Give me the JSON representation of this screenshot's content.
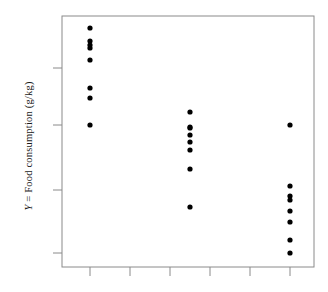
{
  "chart_data": {
    "type": "scatter",
    "title": "",
    "xlabel": "",
    "ylabel": "Y = Food consumption (g/kg)",
    "ylabel_variable": "Y",
    "ylabel_rest": " = Food consumption (g/kg)",
    "grid": false,
    "legend": "none",
    "xlim": [
      0,
      328
    ],
    "ylim": [
      0,
      292
    ],
    "x_tick_labels": [],
    "y_tick_labels": [],
    "x_ticks_px": [
      90,
      130,
      170,
      210,
      250,
      290
    ],
    "y_ticks_px": [
      68,
      125,
      190,
      253
    ],
    "frame_px": {
      "left": 62,
      "right": 314,
      "top": 16,
      "bottom": 267
    },
    "marker": {
      "shape": "circle",
      "color": "#000000",
      "radius": 2.6
    },
    "groups": [
      {
        "name": "group-1",
        "x_px": 90,
        "points_y_px": [
          28,
          41,
          45,
          48,
          60,
          88,
          98,
          125
        ]
      },
      {
        "name": "group-2",
        "x_px": 190,
        "points_y_px": [
          112,
          128,
          127,
          135,
          142,
          150,
          169,
          207
        ]
      },
      {
        "name": "group-3",
        "x_px": 290,
        "points_y_px": [
          125,
          186,
          196,
          200,
          211,
          222,
          240,
          253
        ]
      }
    ],
    "series": [
      {
        "name": "group-1",
        "x": [
          1,
          1,
          1,
          1,
          1,
          1,
          1,
          1
        ],
        "values": [
          95.2,
          90.0,
          88.4,
          87.2,
          82.4,
          71.2,
          67.2,
          56.4
        ]
      },
      {
        "name": "group-2",
        "x": [
          3.5,
          3.5,
          3.5,
          3.5,
          3.5,
          3.5,
          3.5,
          3.5
        ],
        "values": [
          61.2,
          55.6,
          56.0,
          52.8,
          50.0,
          46.8,
          39.2,
          24.0
        ]
      },
      {
        "name": "group-3",
        "x": [
          6,
          6,
          6,
          6,
          6,
          6,
          6,
          6
        ],
        "values": [
          56.4,
          32.0,
          28.0,
          26.4,
          22.0,
          17.6,
          10.4,
          5.2
        ]
      }
    ]
  },
  "axes": {
    "frame_color": "#8a8a8a",
    "tick_color": "#8a8a8a",
    "marker_color": "#000000",
    "background": "#ffffff"
  }
}
